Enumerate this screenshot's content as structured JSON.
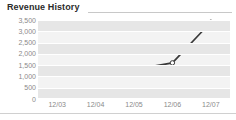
{
  "widget": {
    "title": "Revenue History",
    "background_color": "#ffffff",
    "plot_background_color": "#f3f3f3",
    "band_color": "#e6e6e6",
    "gridline_color": "#ffffff",
    "line_color": "#3a3a3a",
    "marker_fill_color": "#ffffff",
    "axis_text_color": "#8a8a8a",
    "title_text_color": "#2b2b2b"
  },
  "chart_data": {
    "type": "line",
    "title": "Revenue History",
    "xlabel": "",
    "ylabel": "",
    "categories": [
      "12/03",
      "12/04",
      "12/05",
      "12/06",
      "12/07"
    ],
    "series": [
      {
        "name": "Revenue",
        "values": [
          null,
          null,
          1300,
          1600,
          3400
        ]
      }
    ],
    "ylim": [
      0,
      3500
    ],
    "yticks": [
      0,
      500,
      1000,
      1500,
      2000,
      2500,
      3000,
      3500
    ],
    "ytick_labels": [
      "0",
      "500",
      "1,000",
      "1,500",
      "2,000",
      "2,500",
      "3,000",
      "3,500"
    ],
    "xtick_labels": [
      "12/03",
      "12/04",
      "12/05",
      "12/06",
      "12/07"
    ],
    "grid": true,
    "legend": false,
    "markers": "open-circle"
  }
}
